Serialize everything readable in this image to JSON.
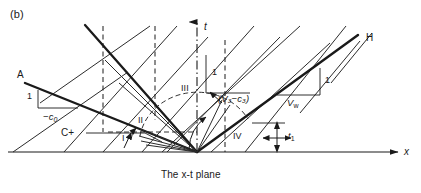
{
  "figure": {
    "panel_label": "(b)",
    "caption": "The x-t plane",
    "axes": {
      "t_label": "t",
      "x_label": "x"
    },
    "labels": {
      "characteristic_A": "A",
      "characteristic_H": "H",
      "c_plus": "C+",
      "slope_one_left": "1",
      "slope_minus_c0": "−c",
      "slope_minus_c0_sub": "0",
      "slope_one_middle": "1",
      "slope_v3_minus_c3": "(V₃−c₃)",
      "slope_one_right": "1",
      "slope_vw": "V",
      "slope_vw_sub": "w",
      "time_t1": "t",
      "time_t1_sub": "1"
    },
    "regions": [
      {
        "id": "region-1",
        "label": "I"
      },
      {
        "id": "region-2",
        "label": "II"
      },
      {
        "id": "region-3",
        "label": "III"
      },
      {
        "id": "region-4",
        "label": "IV"
      }
    ],
    "colors": {
      "ink": "#1a1a1a",
      "line": "#2b2b2b",
      "background": "#ffffff"
    }
  }
}
